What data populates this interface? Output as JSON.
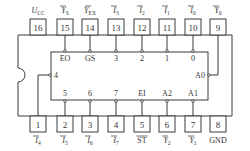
{
  "diagram": {
    "top_pins": [
      {
        "num": "16",
        "label": "U",
        "sub": "CC",
        "overline": false,
        "italic": true,
        "x": 38
      },
      {
        "num": "15",
        "label": "Y",
        "sub": "S",
        "overline": true,
        "italic": true,
        "x": 65
      },
      {
        "num": "14",
        "label": "Y",
        "sub": "EX",
        "overline": true,
        "italic": true,
        "x": 90
      },
      {
        "num": "13",
        "label": "I",
        "sub": "3",
        "overline": true,
        "italic": true,
        "x": 116
      },
      {
        "num": "12",
        "label": "I",
        "sub": "2",
        "overline": true,
        "italic": true,
        "x": 142
      },
      {
        "num": "11",
        "label": "I",
        "sub": "1",
        "overline": true,
        "italic": true,
        "x": 167
      },
      {
        "num": "10",
        "label": "I",
        "sub": "0",
        "overline": true,
        "italic": true,
        "x": 193
      },
      {
        "num": "9",
        "label": "Y",
        "sub": "0",
        "overline": true,
        "italic": true,
        "x": 218
      }
    ],
    "bottom_pins": [
      {
        "num": "1",
        "label": "I",
        "sub": "4",
        "overline": true,
        "italic": true,
        "x": 38
      },
      {
        "num": "2",
        "label": "I",
        "sub": "5",
        "overline": true,
        "italic": true,
        "x": 65
      },
      {
        "num": "3",
        "label": "I",
        "sub": "6",
        "overline": true,
        "italic": true,
        "x": 90
      },
      {
        "num": "4",
        "label": "I",
        "sub": "7",
        "overline": true,
        "italic": true,
        "x": 116
      },
      {
        "num": "5",
        "label": "ST",
        "sub": "",
        "overline": true,
        "italic": false,
        "x": 142
      },
      {
        "num": "6",
        "label": "Y",
        "sub": "2",
        "overline": true,
        "italic": true,
        "x": 167
      },
      {
        "num": "7",
        "label": "Y",
        "sub": "1",
        "overline": true,
        "italic": true,
        "x": 193
      },
      {
        "num": "8",
        "label": "GND",
        "sub": "",
        "overline": false,
        "italic": false,
        "x": 218
      }
    ],
    "inner_top_labels": [
      {
        "text": "EO",
        "x": 65
      },
      {
        "text": "GS",
        "x": 90
      },
      {
        "text": "3",
        "x": 116
      },
      {
        "text": "2",
        "x": 142
      },
      {
        "text": "1",
        "x": 167
      },
      {
        "text": "0",
        "x": 193
      }
    ],
    "inner_bottom_labels": [
      {
        "text": "5",
        "x": 65
      },
      {
        "text": "6",
        "x": 90
      },
      {
        "text": "7",
        "x": 116
      },
      {
        "text": "EI",
        "x": 142
      },
      {
        "text": "A2",
        "x": 167
      },
      {
        "text": "A1",
        "x": 193
      }
    ],
    "inner_left_label": {
      "text": "4"
    },
    "inner_right_label": {
      "text": "A0"
    }
  }
}
